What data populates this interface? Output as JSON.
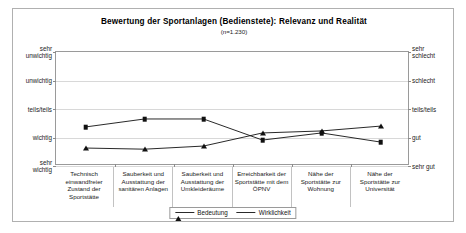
{
  "chart": {
    "title": "Bewertung der Sportanlagen (Bedienstete): Relevanz und Realität",
    "subtitle": "(n=1.230)"
  },
  "chart_data": {
    "type": "line",
    "title": "Bewertung der Sportanlagen (Bedienstete): Relevanz und Realität",
    "subtitle": "(n=1.230)",
    "xlabel": "",
    "ylabel": "",
    "grid": true,
    "legend_position": "bottom",
    "categories": [
      "Technisch einwandfreier Zustand der Sportstätte",
      "Sauberkeit und Ausstattung der sanitären Anlagen",
      "Sauberkeit und Ausstattung der Umkleideräume",
      "Erreichbarkeit der Sportstätte mit dem ÖPNV",
      "Nähe der Sportstätte zur Wohnung",
      "Nähe der Sportstätte zur Universität"
    ],
    "categories_display": [
      "Technisch\neinwandfreier Zustand\nder Sportstätte",
      "Sauberkeit und\nAusstattung der\nsanitären Anlagen",
      "Sauberkeit und\nAusstattung der\nUmkleideräume",
      "Erreichbarkeit der\nSportstätte mit dem\nÖPNV",
      "Nähe der Sportstätte\nzur Wohnung",
      "Nähe der Sportstätte\nzur Universität"
    ],
    "ylim": [
      1,
      5
    ],
    "yticks": [
      1,
      2,
      3,
      4,
      5
    ],
    "ytick_labels_left": [
      "sehr\nunwichtig",
      "unwichtig",
      "teils/teils",
      "wichtig",
      "sehr\nwichtig"
    ],
    "ytick_labels_right": [
      "sehr\nschlecht",
      "schlecht",
      "teils/teils",
      "gut",
      "sehr gut"
    ],
    "series": [
      {
        "name": "Bedeutung",
        "marker": "triangle",
        "color": "#111111",
        "axis": "left",
        "values": [
          4.37,
          4.41,
          4.3,
          3.84,
          3.77,
          3.6
        ]
      },
      {
        "name": "Wirklichkeit",
        "marker": "square",
        "color": "#111111",
        "axis": "right",
        "values": [
          3.63,
          3.35,
          3.35,
          4.09,
          3.84,
          4.16
        ]
      }
    ]
  },
  "legend": {
    "items": [
      {
        "label": "Bedeutung"
      },
      {
        "label": "Wirklichkeit"
      }
    ]
  }
}
